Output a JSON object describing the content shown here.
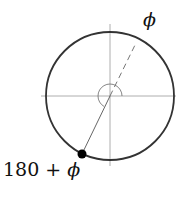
{
  "diagram": {
    "type": "polar-angle-diagram",
    "labels": {
      "top_right": "ϕ",
      "bottom_left_num": "180 + ",
      "bottom_left_sym": "ϕ"
    },
    "geometry": {
      "center": [
        110,
        96
      ],
      "radius": 64,
      "angle_phi_deg": 60,
      "point_angle_deg": 240
    },
    "colors": {
      "circle": "#333333",
      "axes": "#999999",
      "point": "#000000"
    }
  }
}
